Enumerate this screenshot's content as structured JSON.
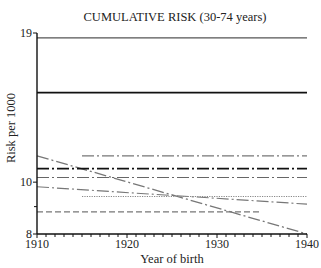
{
  "chart_data": {
    "type": "line",
    "title": "CUMULATIVE RISK (30-74 years)",
    "xlabel": "Year of birth",
    "ylabel": "Risk per 1000",
    "x_ticks": [
      1910,
      1920,
      1930,
      1940
    ],
    "y_tick_labels": [
      8,
      10,
      19
    ],
    "y_minor_ticks": [
      9
    ],
    "xlim": [
      1910,
      1940
    ],
    "ylim": [
      8,
      19
    ],
    "yscale": "log",
    "grid": false,
    "legend": null,
    "series": [
      {
        "name": "series-1",
        "style": "solid",
        "color": "#555555",
        "width": 1.2,
        "x": [
          1910,
          1940
        ],
        "values": [
          18.6,
          18.6
        ]
      },
      {
        "name": "series-2",
        "style": "solid",
        "color": "#111111",
        "width": 1.6,
        "x": [
          1910,
          1940
        ],
        "values": [
          14.7,
          14.7
        ]
      },
      {
        "name": "series-3",
        "style": "dashdot",
        "color": "#777777",
        "width": 1.2,
        "x": [
          1915,
          1940
        ],
        "values": [
          11.2,
          11.2
        ]
      },
      {
        "name": "series-4",
        "style": "dashdot",
        "color": "#777777",
        "width": 1.3,
        "x": [
          1910,
          1940
        ],
        "values": [
          11.2,
          8.0
        ]
      },
      {
        "name": "series-5",
        "style": "dashdot",
        "color": "#111111",
        "width": 1.6,
        "x": [
          1910,
          1940
        ],
        "values": [
          10.6,
          10.6
        ]
      },
      {
        "name": "series-6",
        "style": "dashdot",
        "color": "#666666",
        "width": 1.1,
        "x": [
          1910,
          1940
        ],
        "values": [
          10.2,
          10.2
        ]
      },
      {
        "name": "series-7",
        "style": "dashdot",
        "color": "#777777",
        "width": 1.1,
        "x": [
          1910,
          1940
        ],
        "values": [
          9.8,
          9.1
        ]
      },
      {
        "name": "series-8",
        "style": "dotted",
        "color": "#888888",
        "width": 1.1,
        "x": [
          1915,
          1940
        ],
        "values": [
          9.4,
          9.4
        ]
      },
      {
        "name": "series-9",
        "style": "dashed",
        "color": "#777777",
        "width": 1.1,
        "x": [
          1910,
          1935
        ],
        "values": [
          8.8,
          8.8
        ]
      }
    ]
  }
}
